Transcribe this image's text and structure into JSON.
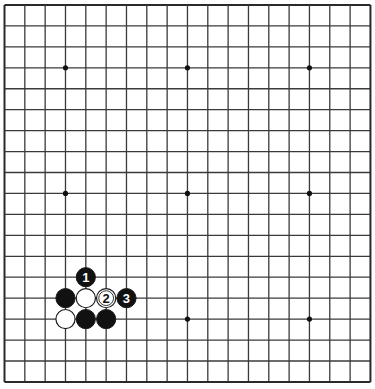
{
  "board": {
    "size": 19,
    "origin": {
      "x": 4.5,
      "y": 5
    },
    "spacing": {
      "x": 20.33,
      "y": 20.94
    },
    "line_color": "#3a3a3a",
    "edge_color": "#2a2a2a",
    "background": "#ffffff",
    "star_points": [
      [
        3,
        3
      ],
      [
        9,
        3
      ],
      [
        15,
        3
      ],
      [
        3,
        9
      ],
      [
        9,
        9
      ],
      [
        15,
        9
      ],
      [
        3,
        15
      ],
      [
        9,
        15
      ],
      [
        15,
        15
      ]
    ]
  },
  "stones": [
    {
      "col": 4,
      "row": 13,
      "color": "black",
      "label": "1"
    },
    {
      "col": 3,
      "row": 14,
      "color": "black",
      "label": ""
    },
    {
      "col": 4,
      "row": 14,
      "color": "white",
      "label": ""
    },
    {
      "col": 5,
      "row": 14,
      "color": "white",
      "label": "2"
    },
    {
      "col": 6,
      "row": 14,
      "color": "black",
      "label": "3"
    },
    {
      "col": 3,
      "row": 15,
      "color": "white",
      "label": ""
    },
    {
      "col": 4,
      "row": 15,
      "color": "black",
      "label": ""
    },
    {
      "col": 5,
      "row": 15,
      "color": "black",
      "label": ""
    }
  ],
  "colors": {
    "black_stone": "#111111",
    "white_stone": "#ffffff",
    "stone_outline": "#1a1a1a"
  }
}
